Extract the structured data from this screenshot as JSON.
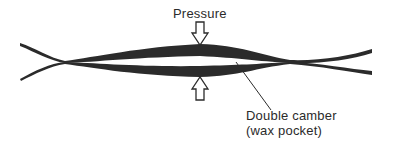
{
  "diagram": {
    "labels": {
      "pressure": "Pressure",
      "callout_line1": "Double camber",
      "callout_line2": "(wax pocket)"
    },
    "arrows": [
      {
        "name": "pressure-arrow-top",
        "direction": "down"
      },
      {
        "name": "pressure-arrow-bottom",
        "direction": "up"
      }
    ],
    "colors": {
      "ink": "#2b2b2b",
      "background": "#ffffff"
    }
  }
}
